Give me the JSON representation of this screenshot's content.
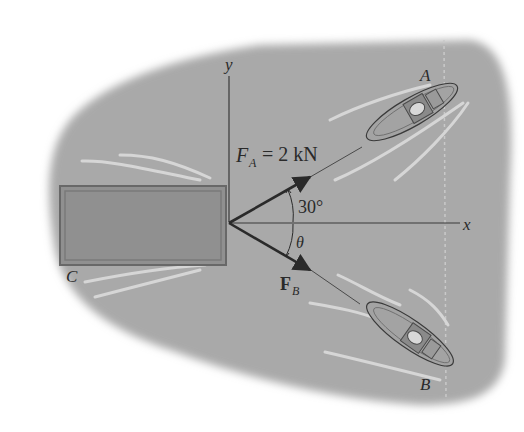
{
  "diagram": {
    "type": "statics-force-diagram",
    "axes": {
      "x_label": "x",
      "y_label": "y"
    },
    "labels": {
      "barge": "C",
      "boat_a": "A",
      "boat_b": "B",
      "force_a_symbol": "F",
      "force_a_sub": "A",
      "force_a_value": "= 2 kN",
      "force_b_symbol": "F",
      "force_b_sub": "B",
      "angle_a": "30°",
      "angle_b": "θ"
    },
    "forces": [
      {
        "name": "F_A",
        "magnitude": "2 kN",
        "angle_deg_from_x": 30,
        "direction": "above x-axis"
      },
      {
        "name": "F_B",
        "magnitude": "unknown",
        "angle": "θ",
        "direction": "below x-axis"
      }
    ],
    "colors": {
      "water": "#a8a8a8",
      "barge_fill": "#8f8f8f",
      "barge_border": "#6a6a6a",
      "lines": "#2a2a2a",
      "wake": "#d4d4d4"
    }
  }
}
